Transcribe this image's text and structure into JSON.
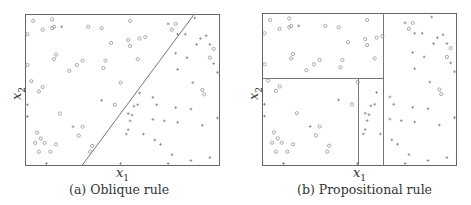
{
  "chart_data": [
    {
      "type": "scatter",
      "title": "",
      "caption": "(a) Oblique rule",
      "xlabel": "x1",
      "ylabel": "x2",
      "xlim": [
        0,
        1
      ],
      "ylim": [
        0,
        1
      ],
      "grid": false,
      "legend": "none",
      "decision_boundary": {
        "kind": "oblique_line",
        "from": [
          0.29,
          0.0
        ],
        "to": [
          0.88,
          1.0
        ]
      },
      "series": [
        {
          "name": "class-circle",
          "marker": "o",
          "points": [
            [
              0.03,
              0.97
            ],
            [
              0.13,
              0.98
            ],
            [
              0.14,
              0.93
            ],
            [
              0.08,
              0.91
            ],
            [
              0.13,
              0.92
            ],
            [
              0.0,
              0.88
            ],
            [
              0.32,
              0.93
            ],
            [
              0.39,
              0.92
            ],
            [
              0.54,
              0.97
            ],
            [
              0.44,
              0.82
            ],
            [
              0.53,
              0.84
            ],
            [
              0.54,
              0.8
            ],
            [
              0.59,
              0.85
            ],
            [
              0.62,
              0.86
            ],
            [
              0.15,
              0.74
            ],
            [
              0.14,
              0.71
            ],
            [
              0.29,
              0.7
            ],
            [
              0.26,
              0.67
            ],
            [
              0.41,
              0.7
            ],
            [
              0.4,
              0.65
            ],
            [
              0.58,
              0.71
            ],
            [
              0.22,
              0.63
            ],
            [
              0.0,
              0.67
            ],
            [
              0.02,
              0.56
            ],
            [
              0.08,
              0.52
            ],
            [
              0.06,
              0.49
            ],
            [
              0.49,
              0.55
            ],
            [
              0.46,
              0.4
            ],
            [
              0.17,
              0.34
            ],
            [
              0.05,
              0.21
            ],
            [
              0.07,
              0.17
            ],
            [
              0.04,
              0.14
            ],
            [
              0.09,
              0.14
            ],
            [
              0.15,
              0.13
            ],
            [
              0.06,
              0.08
            ],
            [
              0.12,
              0.08
            ],
            [
              0.29,
              0.25
            ],
            [
              0.27,
              0.19
            ],
            [
              0.34,
              0.12
            ],
            [
              0.33,
              0.08
            ],
            [
              0.78,
              0.95
            ],
            [
              0.76,
              0.91
            ],
            [
              0.98,
              0.78
            ],
            [
              0.96,
              0.72
            ],
            [
              0.92,
              0.5
            ],
            [
              0.93,
              0.47
            ]
          ]
        },
        {
          "name": "class-plus",
          "marker": "+",
          "points": [
            [
              0.18,
              0.93
            ],
            [
              0.74,
              0.95
            ],
            [
              0.79,
              0.88
            ],
            [
              0.83,
              0.88
            ],
            [
              0.78,
              0.75
            ],
            [
              0.84,
              0.72
            ],
            [
              0.79,
              0.64
            ],
            [
              0.91,
              0.85
            ],
            [
              0.94,
              0.87
            ],
            [
              0.89,
              0.81
            ],
            [
              0.96,
              0.81
            ],
            [
              0.98,
              0.68
            ],
            [
              1.0,
              0.62
            ],
            [
              0.87,
              0.55
            ],
            [
              0.59,
              0.48
            ],
            [
              0.66,
              0.45
            ],
            [
              0.68,
              0.4
            ],
            [
              0.56,
              0.39
            ],
            [
              0.58,
              0.4
            ],
            [
              0.53,
              0.34
            ],
            [
              0.55,
              0.33
            ],
            [
              0.39,
              0.43
            ],
            [
              0.54,
              0.29
            ],
            [
              0.66,
              0.3
            ],
            [
              0.72,
              0.29
            ],
            [
              0.78,
              0.38
            ],
            [
              0.79,
              0.28
            ],
            [
              0.86,
              0.37
            ],
            [
              0.92,
              0.26
            ],
            [
              1.0,
              0.31
            ],
            [
              0.53,
              0.23
            ],
            [
              0.52,
              0.2
            ],
            [
              0.61,
              0.2
            ],
            [
              0.67,
              0.16
            ],
            [
              0.7,
              0.13
            ],
            [
              0.76,
              0.06
            ],
            [
              0.96,
              0.04
            ],
            [
              0.1,
              0.0
            ],
            [
              0.49,
              0.0
            ],
            [
              0.74,
              0.0
            ],
            [
              0.86,
              0.02
            ],
            [
              0.24,
              0.25
            ],
            [
              0.0,
              0.32
            ],
            [
              0.0,
              0.4
            ],
            [
              0.88,
              0.99
            ]
          ]
        }
      ]
    },
    {
      "type": "scatter",
      "title": "",
      "caption": "(b) Propositional rule",
      "xlabel": "x1",
      "ylabel": "x2",
      "xlim": [
        0,
        1
      ],
      "ylim": [
        0,
        1
      ],
      "grid": false,
      "legend": "none",
      "decision_boundary": {
        "kind": "axis_aligned_splits",
        "splits": [
          {
            "axis": "x1",
            "value": 0.63,
            "range": [
              0,
              1
            ]
          },
          {
            "axis": "x2",
            "value": 0.58,
            "range_x1": [
              0,
              0.63
            ]
          },
          {
            "axis": "x1",
            "value": 0.49,
            "range": [
              0,
              0.58
            ]
          }
        ]
      },
      "note": "same data points as panel (a)"
    }
  ],
  "panels": {
    "a": {
      "xlabel": "x",
      "xsub": "1",
      "ylabel": "x",
      "ysub": "2",
      "caption": "(a) Oblique rule"
    },
    "b": {
      "xlabel": "x",
      "xsub": "1",
      "ylabel": "x",
      "ysub": "2",
      "caption": "(b) Propositional rule"
    }
  }
}
